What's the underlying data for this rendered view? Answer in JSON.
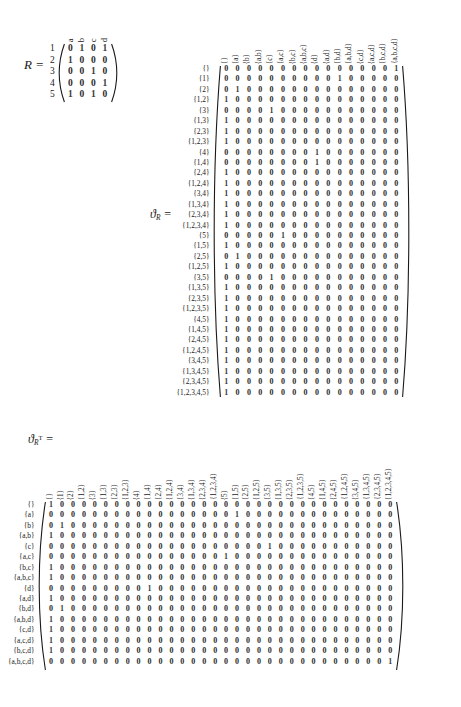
{
  "r_matrix": {
    "label_name": "R",
    "label_equals": "=",
    "col_headers": [
      "a",
      "b",
      "c",
      "d"
    ],
    "row_headers": [
      "1",
      "2",
      "3",
      "4",
      "5"
    ],
    "rows": [
      [
        0,
        1,
        0,
        1
      ],
      [
        1,
        0,
        0,
        0
      ],
      [
        0,
        0,
        1,
        0
      ],
      [
        0,
        0,
        0,
        1
      ],
      [
        1,
        0,
        1,
        0
      ]
    ]
  },
  "theta_r": {
    "label_name": "ϑ",
    "label_sub": "R",
    "label_equals": "=",
    "col_headers": [
      "{}",
      "{a}",
      "{b}",
      "{a,b}",
      "{c}",
      "{a,c}",
      "{b,c}",
      "{a,b,c}",
      "{d}",
      "{a,d}",
      "{b,d}",
      "{a,b,d}",
      "{c,d}",
      "{a,c,d}",
      "{b,c,d}",
      "{a,b,c,d}"
    ],
    "row_headers": [
      "{}",
      "{1}",
      "{2}",
      "{1,2}",
      "{3}",
      "{1,3}",
      "{2,3}",
      "{1,2,3}",
      "{4}",
      "{1,4}",
      "{2,4}",
      "{1,2,4}",
      "{3,4}",
      "{1,3,4}",
      "{2,3,4}",
      "{1,2,3,4}",
      "{5}",
      "{1,5}",
      "{2,5}",
      "{1,2,5}",
      "{3,5}",
      "{1,3,5}",
      "{2,3,5}",
      "{1,2,3,5}",
      "{4,5}",
      "{1,4,5}",
      "{2,4,5}",
      "{1,2,4,5}",
      "{3,4,5}",
      "{1,3,4,5}",
      "{2,3,4,5}",
      "{1,2,3,4,5}"
    ],
    "one_positions": [
      15,
      10,
      1,
      0,
      4,
      0,
      0,
      0,
      8,
      8,
      0,
      0,
      0,
      0,
      0,
      0,
      5,
      0,
      1,
      0,
      4,
      0,
      0,
      0,
      0,
      0,
      0,
      0,
      0,
      0,
      0,
      0
    ]
  },
  "theta_rt": {
    "label_name": "ϑ",
    "label_sub": "R",
    "label_sup": "T",
    "label_equals": "=",
    "col_headers": [
      "{}",
      "{1}",
      "{2}",
      "{1,2}",
      "{3}",
      "{1,3}",
      "{2,3}",
      "{1,2,3}",
      "{4}",
      "{1,4}",
      "{2,4}",
      "{1,2,4}",
      "{3,4}",
      "{1,3,4}",
      "{2,3,4}",
      "{1,2,3,4}",
      "{5}",
      "{1,5}",
      "{2,5}",
      "{1,2,5}",
      "{3,5}",
      "{1,3,5}",
      "{2,3,5}",
      "{1,2,3,5}",
      "{4,5}",
      "{1,4,5}",
      "{2,4,5}",
      "{1,2,4,5}",
      "{3,4,5}",
      "{1,3,4,5}",
      "{2,3,4,5}",
      "{1,2,3,4,5}"
    ],
    "row_headers": [
      "{}",
      "{a}",
      "{b}",
      "{a,b}",
      "{c}",
      "{a,c}",
      "{b,c}",
      "{a,b,c}",
      "{d}",
      "{a,d}",
      "{b,d}",
      "{a,b,d}",
      "{c,d}",
      "{a,c,d}",
      "{b,c,d}",
      "{a,b,c,d}"
    ],
    "one_positions": [
      0,
      17,
      1,
      0,
      20,
      16,
      0,
      0,
      9,
      0,
      1,
      0,
      0,
      0,
      0,
      31
    ]
  }
}
